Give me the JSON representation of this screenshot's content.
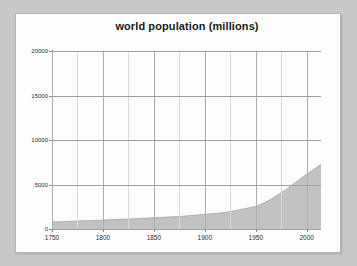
{
  "page": {
    "background_color": "#c9c9c9",
    "sheet_color": "#fdfdfd"
  },
  "chart_data": {
    "type": "area",
    "title": "world population (millions)",
    "xlabel": "",
    "ylabel": "",
    "xlim": [
      1750,
      2014
    ],
    "ylim": [
      0,
      20000
    ],
    "grid": true,
    "legend": "none",
    "series_color": "#c2c2c2",
    "series_line_color": "#a5a5a5",
    "xticks": [
      1750,
      1800,
      1850,
      1900,
      1950,
      2000
    ],
    "xtick_labels": [
      "1750",
      "1800",
      "1850",
      "1900",
      "1950",
      "2000"
    ],
    "yticks": [
      0,
      5000,
      10000,
      15000,
      20000
    ],
    "ytick_labels": [
      "0",
      "5000",
      "10000",
      "15000",
      "20000"
    ],
    "minor_xgrid_step": 25,
    "series": [
      {
        "name": "world population",
        "x": [
          1750,
          1775,
          1800,
          1825,
          1850,
          1875,
          1900,
          1910,
          1920,
          1930,
          1940,
          1950,
          1960,
          1970,
          1980,
          1990,
          2000,
          2010,
          2014
        ],
        "values": [
          791,
          890,
          1000,
          1120,
          1262,
          1400,
          1650,
          1750,
          1860,
          2070,
          2300,
          2536,
          3035,
          3700,
          4458,
          5327,
          6143,
          6930,
          7250
        ]
      }
    ]
  }
}
